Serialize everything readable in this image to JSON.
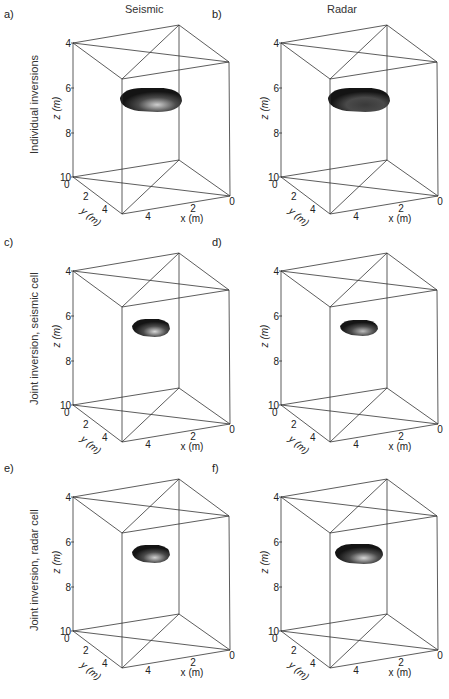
{
  "figure": {
    "columns": [
      {
        "title": "Seismic"
      },
      {
        "title": "Radar"
      }
    ],
    "rows": [
      {
        "label": "Individual inversions"
      },
      {
        "label": "Joint inversion, seismic cell"
      },
      {
        "label": "Joint inversion, radar cell"
      }
    ],
    "panels": [
      {
        "id": "a)",
        "row": 0,
        "col": 0,
        "blob": {
          "cx": 151,
          "cy": 100,
          "rx": 31,
          "ry": 12,
          "highlight": "#cfcfcf"
        }
      },
      {
        "id": "b)",
        "row": 0,
        "col": 1,
        "blob": {
          "cx": 151,
          "cy": 100,
          "rx": 31,
          "ry": 12,
          "highlight": "#3a3a3a"
        }
      },
      {
        "id": "c)",
        "row": 1,
        "col": 0,
        "blob": {
          "cx": 151,
          "cy": 100,
          "rx": 19,
          "ry": 9,
          "highlight": "#d8d8d8"
        }
      },
      {
        "id": "d)",
        "row": 1,
        "col": 1,
        "blob": {
          "cx": 151,
          "cy": 100,
          "rx": 19,
          "ry": 8,
          "highlight": "#bdbdbd"
        }
      },
      {
        "id": "e)",
        "row": 2,
        "col": 0,
        "blob": {
          "cx": 151,
          "cy": 100,
          "rx": 19,
          "ry": 9,
          "highlight": "#d0d0d0"
        }
      },
      {
        "id": "f)",
        "row": 2,
        "col": 1,
        "blob": {
          "cx": 151,
          "cy": 100,
          "rx": 24,
          "ry": 10,
          "highlight": "#d6d6d6"
        }
      }
    ],
    "axes": {
      "z_label": "z (m)",
      "y_label": "y (m)",
      "x_label": "x (m)",
      "z_ticks": [
        "4",
        "6",
        "8",
        "10"
      ],
      "y_ticks": [
        "0",
        "2",
        "4"
      ],
      "x_ticks": [
        "4",
        "2",
        "0"
      ]
    }
  },
  "chart_data": {
    "type": "3d-isosurface",
    "title": "",
    "columns": [
      "Seismic",
      "Radar"
    ],
    "rows": [
      "Individual inversions",
      "Joint inversion, seismic cell",
      "Joint inversion, radar cell"
    ],
    "panels": [
      "a)",
      "b)",
      "c)",
      "d)",
      "e)",
      "f)"
    ],
    "xlabel": "x (m)",
    "ylabel": "y (m)",
    "zlabel": "z (m)",
    "xlim": [
      0,
      5
    ],
    "ylim": [
      0,
      5
    ],
    "zlim": [
      4,
      10
    ],
    "x_ticks": [
      0,
      2,
      4
    ],
    "y_ticks": [
      0,
      2,
      4
    ],
    "z_ticks": [
      4,
      6,
      8,
      10
    ],
    "anomaly_depth_approx_m": [
      6.3,
      7.0
    ],
    "anomaly_relative_size": {
      "a)": "large",
      "b)": "large",
      "c)": "small",
      "d)": "small",
      "e)": "small",
      "f)": "medium"
    }
  }
}
